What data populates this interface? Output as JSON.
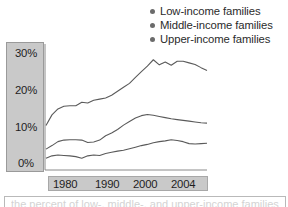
{
  "legend": {
    "position": "top-right",
    "dot_color": "#6b6b6b",
    "items": [
      {
        "label": "Low-income families",
        "icon": "bullet-dot-icon"
      },
      {
        "label": "Middle-income families",
        "icon": "bullet-dot-icon"
      },
      {
        "label": "Upper-income families",
        "icon": "bullet-dot-icon"
      }
    ]
  },
  "axes": {
    "y_ticks": [
      "30%",
      "20%",
      "10%",
      "0%"
    ],
    "x_ticks": [
      "1980",
      "1990",
      "2000",
      "2004"
    ],
    "label_panel_color": "#c9c9c9",
    "axis_line_color": "#8a8a8a"
  },
  "caption": {
    "text": "the percent of low-, middle-, and upper-income families"
  },
  "chart_data": {
    "type": "line",
    "title": "",
    "subtitle": "",
    "xlabel": "",
    "ylabel": "",
    "xlim": [
      1977,
      2004
    ],
    "ylim": [
      0,
      32
    ],
    "grid": false,
    "legend_position": "top-right",
    "y_tick_values": [
      0,
      10,
      20,
      30
    ],
    "y_tick_labels": [
      "0%",
      "10%",
      "20%",
      "30%"
    ],
    "x_tick_values": [
      1980,
      1990,
      2000,
      2004
    ],
    "x_tick_labels": [
      "1980",
      "1990",
      "2000",
      "2004"
    ],
    "series": [
      {
        "name": "Upper-income families",
        "color": "#5a5a5a",
        "x": [
          1977,
          1978,
          1979,
          1980,
          1981,
          1982,
          1983,
          1984,
          1985,
          1986,
          1987,
          1988,
          1989,
          1990,
          1991,
          1992,
          1993,
          1994,
          1995,
          1996,
          1997,
          1998,
          1999,
          2000,
          2001,
          2002,
          2003,
          2004
        ],
        "values": [
          11.3,
          14.0,
          15.5,
          16.2,
          16.3,
          16.3,
          17.2,
          17.0,
          17.7,
          18.0,
          18.3,
          19.0,
          20.0,
          21.0,
          22.0,
          23.5,
          25.0,
          26.4,
          28.0,
          26.7,
          27.4,
          26.6,
          27.6,
          27.6,
          27.2,
          26.8,
          26.0,
          25.3
        ]
      },
      {
        "name": "Middle-income families",
        "color": "#5a5a5a",
        "x": [
          1977,
          1978,
          1979,
          1980,
          1981,
          1982,
          1983,
          1984,
          1985,
          1986,
          1987,
          1988,
          1989,
          1990,
          1991,
          1992,
          1993,
          1994,
          1995,
          1996,
          1997,
          1998,
          1999,
          2000,
          2001,
          2002,
          2003,
          2004
        ],
        "values": [
          5.3,
          6.2,
          7.2,
          7.6,
          7.7,
          7.7,
          7.6,
          7.0,
          7.1,
          7.6,
          8.7,
          9.4,
          10.3,
          11.4,
          12.3,
          13.2,
          13.8,
          14.1,
          13.9,
          13.6,
          13.3,
          13.0,
          12.8,
          12.6,
          12.4,
          12.2,
          12.0,
          11.9
        ]
      },
      {
        "name": "Low-income families",
        "color": "#5a5a5a",
        "x": [
          1977,
          1978,
          1979,
          1980,
          1981,
          1982,
          1983,
          1984,
          1985,
          1986,
          1987,
          1988,
          1989,
          1990,
          1991,
          1992,
          1993,
          1994,
          1995,
          1996,
          1997,
          1998,
          1999,
          2000,
          2001,
          2002,
          2003,
          2004
        ],
        "values": [
          3.0,
          3.6,
          3.8,
          3.7,
          3.6,
          3.4,
          3.0,
          3.6,
          3.8,
          3.7,
          4.2,
          4.5,
          4.8,
          5.0,
          5.4,
          5.8,
          6.2,
          6.5,
          6.9,
          7.2,
          7.4,
          7.7,
          7.5,
          7.2,
          6.7,
          6.6,
          6.7,
          6.8
        ]
      }
    ]
  }
}
